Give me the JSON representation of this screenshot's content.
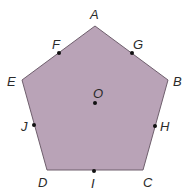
{
  "diagram": {
    "type": "regular-pentagon",
    "fill_color": "#b9a3b7",
    "stroke_color": "#6f5f6d",
    "dot_color": "#111111",
    "vertices": [
      {
        "name": "A",
        "x": 95,
        "y": 26
      },
      {
        "name": "B",
        "x": 168,
        "y": 80
      },
      {
        "name": "C",
        "x": 143,
        "y": 170
      },
      {
        "name": "D",
        "x": 47,
        "y": 170
      },
      {
        "name": "E",
        "x": 22,
        "y": 80
      }
    ],
    "labels": {
      "A": "A",
      "B": "B",
      "C": "C",
      "D": "D",
      "E": "E",
      "F": "F",
      "G": "G",
      "H": "H",
      "I": "I",
      "J": "J",
      "O": "O"
    },
    "midpoints": [
      {
        "name": "F",
        "x": 59,
        "y": 53,
        "between": [
          "A",
          "E"
        ]
      },
      {
        "name": "G",
        "x": 132,
        "y": 53,
        "between": [
          "A",
          "B"
        ]
      },
      {
        "name": "H",
        "x": 155,
        "y": 126,
        "between": [
          "B",
          "C"
        ]
      },
      {
        "name": "I",
        "x": 94,
        "y": 171,
        "between": [
          "C",
          "D"
        ]
      },
      {
        "name": "J",
        "x": 34,
        "y": 125,
        "between": [
          "D",
          "E"
        ]
      }
    ],
    "center": {
      "name": "O",
      "x": 95,
      "y": 103
    }
  }
}
